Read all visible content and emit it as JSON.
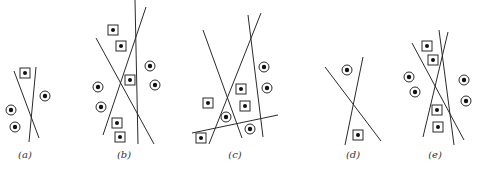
{
  "figure": {
    "ink": "#2a2a2a",
    "panels": [
      {
        "id": "a",
        "label": "(a)",
        "label_pos": [
          25,
          158
        ],
        "lines": [
          [
            14,
            71,
            39,
            138
          ],
          [
            36,
            67,
            29,
            142
          ]
        ],
        "squares": [
          [
            25,
            73
          ]
        ],
        "circles": [
          [
            45,
            96
          ],
          [
            11,
            110
          ],
          [
            15,
            127
          ]
        ]
      },
      {
        "id": "b",
        "label": "(b)",
        "label_pos": [
          124,
          158
        ],
        "lines": [
          [
            135,
            0,
            138,
            144
          ],
          [
            96,
            38,
            154,
            144
          ],
          [
            146,
            7,
            103,
            135
          ]
        ],
        "squares": [
          [
            113,
            30
          ],
          [
            121,
            46
          ],
          [
            130,
            80
          ],
          [
            117,
            123
          ],
          [
            120,
            137
          ]
        ],
        "circles": [
          [
            150,
            66
          ],
          [
            155,
            85
          ],
          [
            98,
            87
          ],
          [
            101,
            107
          ]
        ]
      },
      {
        "id": "c",
        "label": "(c)",
        "label_pos": [
          235,
          158
        ],
        "lines": [
          [
            203,
            30,
            242,
            138
          ],
          [
            261,
            13,
            209,
            144
          ],
          [
            248,
            15,
            263,
            137
          ],
          [
            192,
            133,
            278,
            115
          ]
        ],
        "squares": [
          [
            241,
            89
          ],
          [
            208,
            103
          ],
          [
            245,
            106
          ],
          [
            201,
            138
          ]
        ],
        "circles": [
          [
            264,
            67
          ],
          [
            267,
            88
          ],
          [
            226,
            117
          ],
          [
            250,
            129
          ]
        ]
      },
      {
        "id": "d",
        "label": "(d)",
        "label_pos": [
          353,
          158
        ],
        "lines": [
          [
            325,
            67,
            381,
            141
          ],
          [
            363,
            57,
            345,
            145
          ]
        ],
        "squares": [
          [
            358,
            135
          ]
        ],
        "circles": [
          [
            347,
            70
          ]
        ]
      },
      {
        "id": "e",
        "label": "(e)",
        "label_pos": [
          435,
          158
        ],
        "lines": [
          [
            412,
            43,
            464,
            140
          ],
          [
            439,
            30,
            454,
            145
          ],
          [
            448,
            32,
            423,
            137
          ]
        ],
        "squares": [
          [
            427,
            46
          ],
          [
            433,
            60
          ],
          [
            437,
            110
          ],
          [
            438,
            127
          ]
        ],
        "circles": [
          [
            409,
            77
          ],
          [
            415,
            92
          ],
          [
            464,
            80
          ],
          [
            466,
            101
          ]
        ]
      }
    ]
  }
}
